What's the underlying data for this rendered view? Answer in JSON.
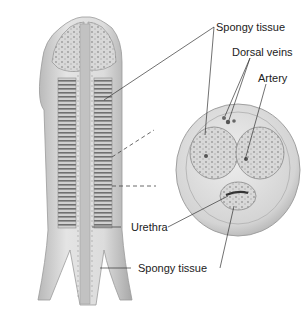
{
  "diagram": {
    "labels": {
      "spongy_tissue_top": "Spongy tissue",
      "dorsal_veins": "Dorsal veins",
      "artery": "Artery",
      "urethra": "Urethra",
      "spongy_tissue_bottom": "Spongy tissue"
    },
    "colors": {
      "background": "#ffffff",
      "tissue_light": "#e6e6e6",
      "tissue_mid": "#c8c8c8",
      "tissue_dark": "#8a8a8a",
      "leader_line": "#333333",
      "text": "#222222"
    }
  }
}
